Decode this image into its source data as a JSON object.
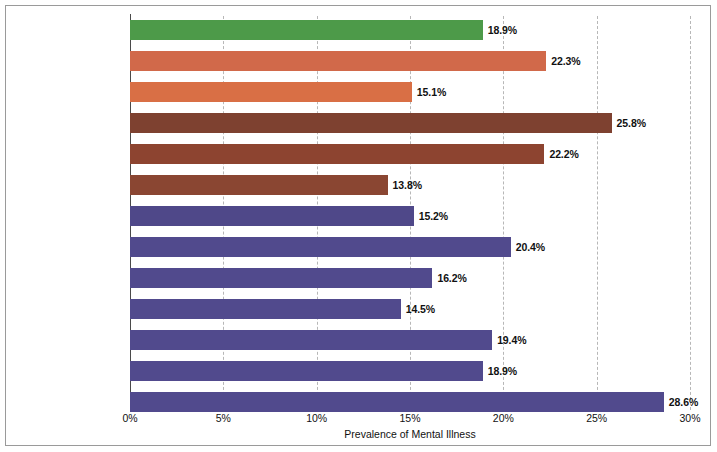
{
  "chart_data": {
    "type": "bar",
    "orientation": "horizontal",
    "title": "",
    "xlabel": "Prevalence of Mental Illness",
    "ylabel": "",
    "xlim": [
      0,
      30
    ],
    "xticks": [
      "0%",
      "5%",
      "10%",
      "15%",
      "20%",
      "25%",
      "30%"
    ],
    "xtick_values": [
      0,
      5,
      10,
      15,
      20,
      25,
      30
    ],
    "grid": "vertical-dashed",
    "legend": "none",
    "categories": [
      "Overall",
      "Female",
      "Male",
      "18–25",
      "26–49",
      "50+",
      "Hispanic or Latino*",
      "White",
      "Black",
      "Asian",
      "Native Hawaiian/\nOther Pacific Islander",
      "American Indian/\nAlaskan Native",
      "Bi- or Multiracial"
    ],
    "values": [
      18.9,
      22.3,
      15.1,
      25.8,
      22.2,
      13.8,
      15.2,
      20.4,
      16.2,
      14.5,
      19.4,
      18.9,
      28.6
    ],
    "value_labels": [
      "18.9%",
      "22.3%",
      "15.1%",
      "25.8%",
      "22.2%",
      "13.8%",
      "15.2%",
      "20.4%",
      "16.2%",
      "14.5%",
      "19.4%",
      "18.9%",
      "28.6%"
    ],
    "bar_colors": [
      "#4d9a49",
      "#d1694a",
      "#d96f45",
      "#7e4130",
      "#8d4430",
      "#8a4632",
      "#4f4889",
      "#514a8d",
      "#514a8d",
      "#514a8d",
      "#514a8d",
      "#514a8d",
      "#514a8d"
    ],
    "emphasized_categories": [
      "Overall"
    ],
    "colors": {
      "green": "#4d9a49",
      "salmon": "#d96f45",
      "brown": "#8a4632",
      "purple": "#514a8d",
      "gridline": "#b7b7b7",
      "axis": "#4a4a4a",
      "frame": "#9a9a9a",
      "text": "#111111",
      "background": "#ffffff"
    }
  }
}
